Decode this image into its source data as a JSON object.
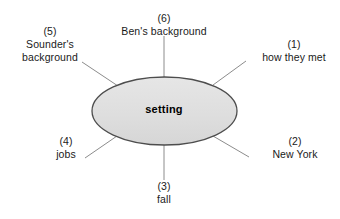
{
  "diagram": {
    "type": "concept-web",
    "center": {
      "label": "setting",
      "shape": "ellipse",
      "fill_color": "#e0e0e0",
      "stroke_color": "#4d4d4d"
    },
    "line_color": "#808080",
    "text_color": "#1a1a1a",
    "background_color": "#ffffff",
    "nodes": [
      {
        "number": "(1)",
        "label": "how they met",
        "position": "upper-right"
      },
      {
        "number": "(2)",
        "label": "New York",
        "position": "lower-right"
      },
      {
        "number": "(3)",
        "label": "fall",
        "position": "bottom"
      },
      {
        "number": "(4)",
        "label": "jobs",
        "position": "lower-left"
      },
      {
        "number": "(5)",
        "label": "Sounder's background",
        "label_line1": "Sounder's",
        "label_line2": "background",
        "position": "upper-left"
      },
      {
        "number": "(6)",
        "label": "Ben's background",
        "position": "top"
      }
    ]
  }
}
